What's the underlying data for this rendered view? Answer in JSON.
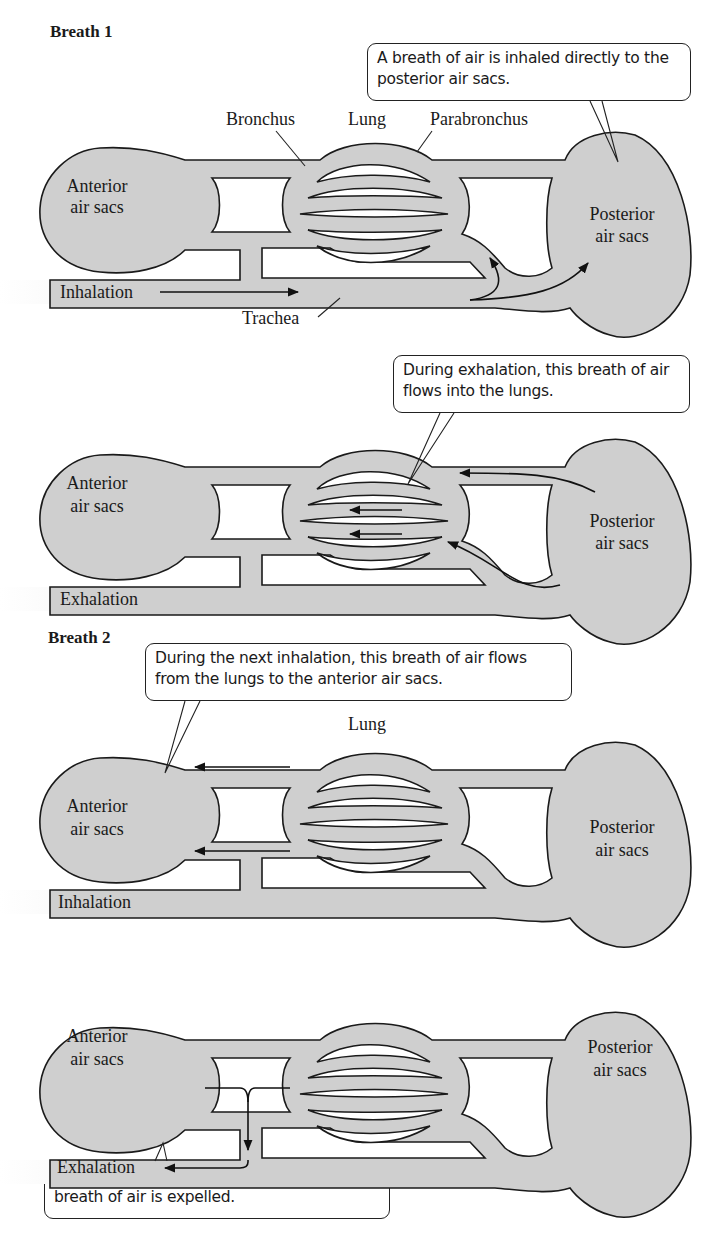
{
  "colors": {
    "tissue": "#cfcfcf",
    "outline": "#1a1a1a",
    "background": "#ffffff"
  },
  "breath1": {
    "heading": "Breath 1",
    "panel_inhale": {
      "callout": "A breath of air is inhaled directly to the posterior air sacs.",
      "labels": {
        "bronchus": "Bronchus",
        "lung": "Lung",
        "parabronchus": "Parabronchus",
        "anterior_1": "Anterior",
        "anterior_2": "air sacs",
        "posterior_1": "Posterior",
        "posterior_2": "air sacs",
        "airway": "Inhalation",
        "trachea": "Trachea"
      }
    },
    "panel_exhale": {
      "callout": "During exhalation, this breath of air flows into the lungs.",
      "labels": {
        "anterior_1": "Anterior",
        "anterior_2": "air sacs",
        "posterior_1": "Posterior",
        "posterior_2": "air sacs",
        "airway": "Exhalation"
      }
    }
  },
  "breath2": {
    "heading": "Breath 2",
    "panel_inhale": {
      "callout": "During the next inhalation, this breath of air flows from the lungs to the anterior air sacs.",
      "labels": {
        "lung": "Lung",
        "anterior_1": "Anterior",
        "anterior_2": "air sacs",
        "posterior_1": "Posterior",
        "posterior_2": "air sacs",
        "airway": "Inhalation"
      }
    },
    "panel_exhale": {
      "callout": "Finally, during the next exhalation, the breath of air is expelled.",
      "labels": {
        "anterior_1": "Anterior",
        "anterior_2": "air sacs",
        "posterior_1": "Posterior",
        "posterior_2": "air sacs",
        "airway": "Exhalation"
      }
    }
  }
}
